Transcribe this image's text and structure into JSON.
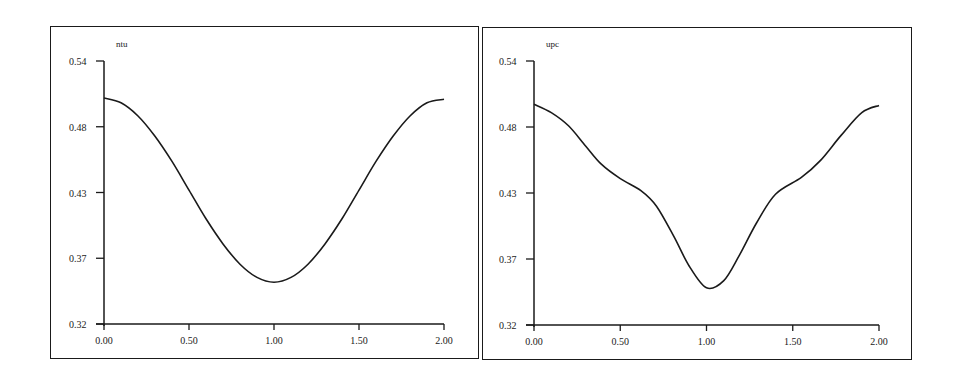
{
  "chart_data": [
    {
      "type": "line",
      "title": "ntu",
      "xlabel": "",
      "ylabel": "",
      "xlim": [
        0,
        2
      ],
      "ylim": [
        0.32,
        0.54
      ],
      "x_ticks": [
        "0.00",
        "0.50",
        "1.00",
        "1.50",
        "2.00"
      ],
      "y_ticks": [
        "0.32",
        "0.37",
        "0.43",
        "0.48",
        "0.54"
      ],
      "grid": false,
      "legend": null,
      "series": [
        {
          "name": "ntu",
          "x": [
            0.0,
            0.1,
            0.2,
            0.3,
            0.4,
            0.5,
            0.6,
            0.7,
            0.8,
            0.9,
            1.0,
            1.1,
            1.2,
            1.3,
            1.4,
            1.5,
            1.6,
            1.7,
            1.8,
            1.9,
            2.0
          ],
          "values": [
            0.509,
            0.505,
            0.494,
            0.477,
            0.456,
            0.432,
            0.408,
            0.387,
            0.37,
            0.359,
            0.355,
            0.359,
            0.37,
            0.387,
            0.408,
            0.432,
            0.456,
            0.477,
            0.494,
            0.505,
            0.508
          ]
        }
      ]
    },
    {
      "type": "line",
      "title": "upc",
      "xlabel": "",
      "ylabel": "",
      "xlim": [
        0,
        2
      ],
      "ylim": [
        0.32,
        0.54
      ],
      "x_ticks": [
        "0.00",
        "0.50",
        "1.00",
        "1.50",
        "2.00"
      ],
      "y_ticks": [
        "0.32",
        "0.37",
        "0.43",
        "0.48",
        "0.54"
      ],
      "grid": false,
      "legend": null,
      "series": [
        {
          "name": "upc",
          "x": [
            0.0,
            0.1,
            0.2,
            0.3,
            0.39,
            0.5,
            0.62,
            0.71,
            0.81,
            0.9,
            1.0,
            1.1,
            1.19,
            1.29,
            1.4,
            1.55,
            1.66,
            1.78,
            1.9,
            2.0
          ],
          "values": [
            0.504,
            0.497,
            0.486,
            0.469,
            0.454,
            0.442,
            0.432,
            0.419,
            0.394,
            0.369,
            0.351,
            0.357,
            0.378,
            0.405,
            0.429,
            0.443,
            0.457,
            0.478,
            0.497,
            0.503
          ]
        }
      ]
    }
  ],
  "panels": {
    "left": {
      "label": "ntu"
    },
    "right": {
      "label": "upc"
    }
  },
  "colors": {
    "line": "#1a1a1a",
    "frame": "#1a1a1a",
    "background": "#ffffff"
  }
}
